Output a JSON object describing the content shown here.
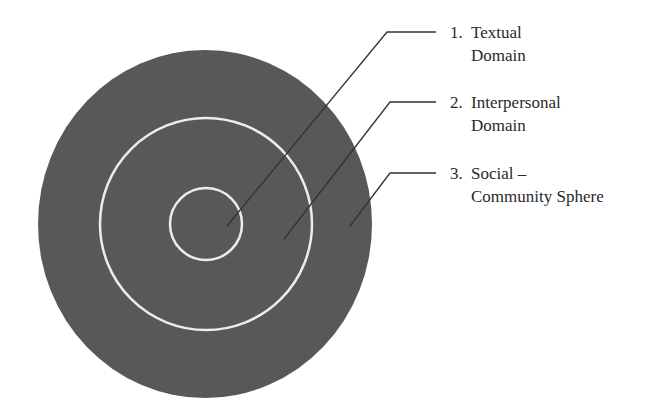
{
  "diagram": {
    "type": "concentric-circles",
    "colors": {
      "disc_fill": "#585858",
      "ring_stroke": "#ececec",
      "leader_line": "#333333",
      "text": "#2a2a2a",
      "background": "#ffffff"
    },
    "layers": [
      {
        "number": "1.",
        "line1": "Textual",
        "line2": "Domain",
        "ring": "inner"
      },
      {
        "number": "2.",
        "line1": "Interpersonal",
        "line2": "Domain",
        "ring": "middle"
      },
      {
        "number": "3.",
        "line1": "Social –",
        "line2": "Community Sphere",
        "ring": "outer"
      }
    ]
  }
}
